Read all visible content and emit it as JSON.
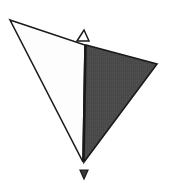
{
  "figure": {
    "name": "two-triangle-polyhedron-diagram",
    "type": "diagram",
    "canvas": {
      "width": 170,
      "height": 194,
      "background": "#ffffff"
    },
    "colors": {
      "background": "#ffffff",
      "light_face_fill": "#fdfdfd",
      "dark_face_fill": "#4b4b4b",
      "outline_stroke": "#1a1a1a",
      "marker_fill": "#3a3a3a",
      "marker_stroke": "#1a1a1a"
    },
    "vertices": {
      "left_apex": {
        "x": 10,
        "y": 20
      },
      "top_apex": {
        "x": 85,
        "y": 45
      },
      "right_apex": {
        "x": 157,
        "y": 64
      },
      "bottom_apex": {
        "x": 83,
        "y": 162
      }
    },
    "faces": [
      {
        "label": "light-face",
        "fill": "#fdfdfd",
        "points": "10,20 85,45 83,162"
      },
      {
        "label": "dark-face",
        "fill": "#4b4b4b",
        "points": "86,45 157,64 84,162"
      }
    ],
    "shared_edge": {
      "from": "top_apex",
      "to": "bottom_apex"
    },
    "markers": [
      {
        "label": "top-arrow-marker",
        "direction": "up",
        "filled": false,
        "points": "77,41 84,30 89,41"
      },
      {
        "label": "bottom-arrow-marker",
        "direction": "down",
        "filled": true,
        "points": "80,170 88,170 84,179"
      }
    ],
    "stroke_width": 1.6
  }
}
